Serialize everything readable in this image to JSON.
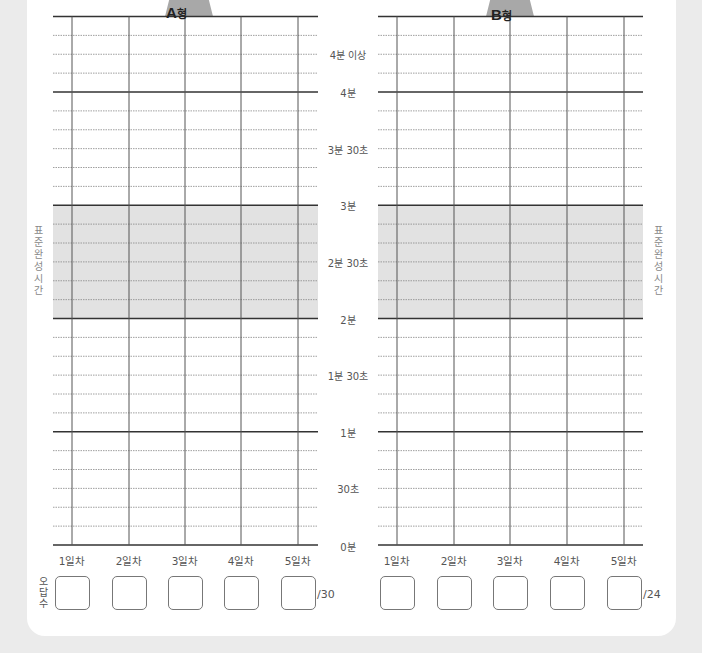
{
  "charts": [
    {
      "id": "A",
      "tab_label_letter": "A",
      "tab_label_suffix": "형",
      "days": [
        "1일차",
        "2일차",
        "3일차",
        "4일차",
        "5일차"
      ],
      "wrong_answer_total": "/30",
      "wrong_answers": [
        "",
        "",
        "",
        "",
        ""
      ]
    },
    {
      "id": "B",
      "tab_label_letter": "B",
      "tab_label_suffix": "형",
      "days": [
        "1일차",
        "2일차",
        "3일차",
        "4일차",
        "5일차"
      ],
      "wrong_answer_total": "/24",
      "wrong_answers": [
        "",
        "",
        "",
        "",
        ""
      ]
    }
  ],
  "time_axis": {
    "labels": [
      {
        "text": "4분 이상",
        "seconds": 260
      },
      {
        "text": "4분",
        "seconds": 240
      },
      {
        "text": "3분 30초",
        "seconds": 210
      },
      {
        "text": "3분",
        "seconds": 180
      },
      {
        "text": "2분 30초",
        "seconds": 150
      },
      {
        "text": "2분",
        "seconds": 120
      },
      {
        "text": "1분 30초",
        "seconds": 90
      },
      {
        "text": "1분",
        "seconds": 60
      },
      {
        "text": "30초",
        "seconds": 30
      },
      {
        "text": "0분",
        "seconds": 0
      }
    ],
    "range_seconds": [
      0,
      280
    ],
    "step_seconds": 10,
    "major_lines_seconds": [
      0,
      60,
      120,
      180,
      240,
      280
    ]
  },
  "standard_time": {
    "label": "표준완성시간",
    "from_seconds": 120,
    "to_seconds": 180,
    "color": "#e2e2e2"
  },
  "wrong_answer_label": "오답수",
  "colors": {
    "tab": "#a8a8a8",
    "major_line": "#333333",
    "minor_line": "#888888",
    "vertical_line": "#555555"
  }
}
